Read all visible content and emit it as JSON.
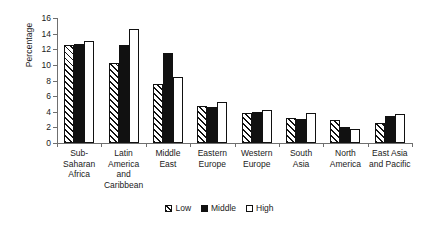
{
  "chart_data": {
    "type": "bar",
    "title": "",
    "xlabel": "",
    "ylabel": "Percentage",
    "ylim": [
      0,
      16
    ],
    "yticks": [
      0,
      2,
      4,
      6,
      8,
      10,
      12,
      14,
      16
    ],
    "grid": false,
    "legend_position": "bottom",
    "categories": [
      "Sub-Saharan Africa",
      "Latin America and Caribbean",
      "Middle East",
      "Eastern Europe",
      "Western Europe",
      "South Asia",
      "North America",
      "East Asia and Pacific"
    ],
    "category_lines": [
      [
        "Sub-",
        "Saharan",
        "Africa"
      ],
      [
        "Latin",
        "America",
        "and",
        "Caribbean"
      ],
      [
        "Middle",
        "East"
      ],
      [
        "Eastern",
        "Europe"
      ],
      [
        "Western",
        "Europe"
      ],
      [
        "South",
        "Asia"
      ],
      [
        "North",
        "America"
      ],
      [
        "East Asia",
        "and Pacific"
      ]
    ],
    "series": [
      {
        "name": "Low",
        "style": "hatched",
        "color": "#ffffff",
        "values": [
          12.6,
          10.2,
          7.5,
          4.8,
          3.9,
          3.2,
          2.9,
          2.6
        ]
      },
      {
        "name": "Middle",
        "style": "solid",
        "color": "#111111",
        "values": [
          12.7,
          12.6,
          11.5,
          4.6,
          4.0,
          3.1,
          2.1,
          3.4
        ]
      },
      {
        "name": "High",
        "style": "open",
        "color": "#ffffff",
        "values": [
          13.0,
          14.6,
          8.5,
          5.2,
          4.2,
          3.9,
          1.8,
          3.7
        ]
      }
    ]
  },
  "legend": {
    "items": [
      {
        "label": "Low"
      },
      {
        "label": "Middle"
      },
      {
        "label": "High"
      }
    ]
  }
}
